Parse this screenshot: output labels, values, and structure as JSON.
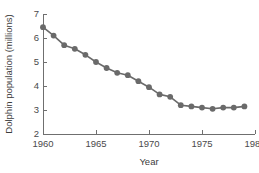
{
  "chart_data": {
    "type": "line",
    "title": "",
    "subtitle": "",
    "xlabel": "Year",
    "ylabel": "Dolphin population (millions)",
    "xlim": [
      1960,
      1980
    ],
    "ylim": [
      2,
      7
    ],
    "xticks": [
      1960,
      1965,
      1970,
      1975,
      1980
    ],
    "yticks": [
      2,
      3,
      4,
      5,
      6,
      7
    ],
    "xtick_labels": [
      "1960",
      "1965",
      "1970",
      "1975",
      "1980"
    ],
    "ytick_labels": [
      "2",
      "3",
      "4",
      "5",
      "6",
      "7"
    ],
    "grid": false,
    "legend": false,
    "legend_position": "none",
    "marker": "circle",
    "marker_color": "#6a6a6a",
    "line_color": "#6a6a6a",
    "axis_color": "#6f6f6f",
    "background": "#ffffff",
    "x": [
      1960,
      1961,
      1962,
      1963,
      1964,
      1965,
      1966,
      1967,
      1968,
      1969,
      1970,
      1971,
      1972,
      1973,
      1974,
      1975,
      1976,
      1977,
      1978,
      1979
    ],
    "values": [
      6.45,
      6.1,
      5.7,
      5.55,
      5.3,
      5.0,
      4.75,
      4.55,
      4.45,
      4.2,
      3.95,
      3.65,
      3.55,
      3.2,
      3.15,
      3.1,
      3.05,
      3.1,
      3.1,
      3.15
    ],
    "series": [
      {
        "name": "Dolphin population",
        "values": [
          6.45,
          6.1,
          5.7,
          5.55,
          5.3,
          5.0,
          4.75,
          4.55,
          4.45,
          4.2,
          3.95,
          3.65,
          3.55,
          3.2,
          3.15,
          3.1,
          3.05,
          3.1,
          3.1,
          3.15
        ]
      }
    ],
    "annotations": []
  }
}
